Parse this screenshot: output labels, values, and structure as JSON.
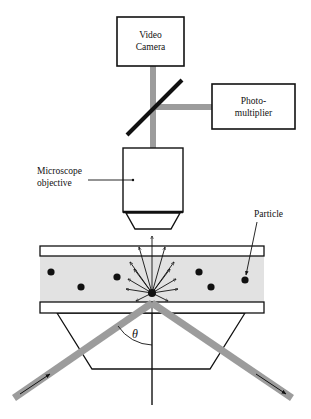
{
  "diagram": {
    "type": "schematic",
    "colors": {
      "beam": "#9c9c9c",
      "sample_fill": "#e2e2e2",
      "stroke": "#111111",
      "particle": "#111111"
    },
    "labels": {
      "camera_line1": "Video",
      "camera_line2": "Camera",
      "pmt_line1": "Photo-",
      "pmt_line2": "multiplier",
      "objective_line1": "Microscope",
      "objective_line2": "objective",
      "particle": "Particle",
      "angle": "θ"
    },
    "components": [
      {
        "name": "video-camera",
        "shape": "box"
      },
      {
        "name": "beam-splitter-mirror",
        "shape": "diagonal-line"
      },
      {
        "name": "photomultiplier",
        "shape": "box"
      },
      {
        "name": "microscope-objective",
        "shape": "box-with-tapered-tip"
      },
      {
        "name": "top-slide",
        "shape": "rectangle"
      },
      {
        "name": "sample-region",
        "shape": "shaded-rectangle"
      },
      {
        "name": "bottom-slide",
        "shape": "rectangle"
      },
      {
        "name": "prism",
        "shape": "trapezoid"
      },
      {
        "name": "incident-beam",
        "shape": "thick-line-with-arrow"
      },
      {
        "name": "reflected-beam",
        "shape": "thick-line-with-arrow"
      }
    ],
    "particles": [
      {
        "x": 51,
        "y": 272
      },
      {
        "x": 81,
        "y": 287
      },
      {
        "x": 117,
        "y": 277
      },
      {
        "x": 199,
        "y": 272
      },
      {
        "x": 211,
        "y": 287
      },
      {
        "x": 245,
        "y": 280
      }
    ],
    "scattering_particle": {
      "x": 152,
      "y": 293
    },
    "scatter_angles_deg": [
      90,
      72,
      108,
      56,
      124,
      40,
      140,
      24,
      156,
      8,
      172,
      -14,
      194
    ]
  }
}
